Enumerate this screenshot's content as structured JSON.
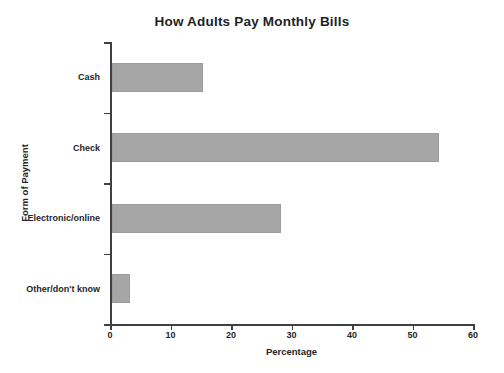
{
  "chart_data": {
    "type": "bar",
    "orientation": "horizontal",
    "title": "How Adults Pay Monthly Bills",
    "xlabel": "Percentage",
    "ylabel": "Form of Payment",
    "categories": [
      "Cash",
      "Check",
      "Electronic/online",
      "Other/don't know"
    ],
    "values": [
      15,
      54,
      28,
      3
    ],
    "xlim": [
      0,
      60
    ],
    "x_ticks": [
      0,
      10,
      20,
      30,
      40,
      50,
      60
    ],
    "legend": "none",
    "grid": "off",
    "bar_color": "#a6a6a6",
    "axis_color": "#404040",
    "text_color": "#262626",
    "background": "#ffffff"
  }
}
